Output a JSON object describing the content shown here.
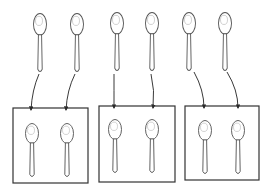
{
  "diagram": {
    "stroke_color": "#555555",
    "box_color": "#333333",
    "arrow_color": "#222222",
    "top_spoons": [
      {
        "id": "spoon-1",
        "x": 40,
        "y": 14
      },
      {
        "id": "spoon-2",
        "x": 77,
        "y": 14
      },
      {
        "id": "spoon-3",
        "x": 117,
        "y": 13
      },
      {
        "id": "spoon-4",
        "x": 152,
        "y": 13
      },
      {
        "id": "spoon-5",
        "x": 189,
        "y": 13
      },
      {
        "id": "spoon-6",
        "x": 225,
        "y": 13
      }
    ],
    "groups": [
      {
        "id": "group-1",
        "box": {
          "x": 13,
          "y": 108,
          "w": 75,
          "h": 75
        },
        "spoons": [
          {
            "x": 32,
            "y": 124
          },
          {
            "x": 67,
            "y": 124
          }
        ]
      },
      {
        "id": "group-2",
        "box": {
          "x": 99,
          "y": 106,
          "w": 76,
          "h": 76
        },
        "spoons": [
          {
            "x": 115,
            "y": 120
          },
          {
            "x": 152,
            "y": 120
          }
        ]
      },
      {
        "id": "group-3",
        "box": {
          "x": 185,
          "y": 106,
          "w": 74,
          "h": 74
        },
        "spoons": [
          {
            "x": 205,
            "y": 121
          },
          {
            "x": 238,
            "y": 121
          }
        ]
      }
    ],
    "arrows": [
      {
        "from": [
          39,
          74
        ],
        "ctrl": [
          32,
          90
        ],
        "to": [
          31,
          110
        ]
      },
      {
        "from": [
          75,
          74
        ],
        "ctrl": [
          67,
          90
        ],
        "to": [
          66,
          110
        ]
      },
      {
        "from": [
          114,
          74
        ],
        "ctrl": [
          114,
          90
        ],
        "to": [
          114,
          108
        ]
      },
      {
        "from": [
          151,
          74
        ],
        "ctrl": [
          155,
          90
        ],
        "to": [
          153,
          108
        ]
      },
      {
        "from": [
          194,
          72
        ],
        "ctrl": [
          204,
          90
        ],
        "to": [
          204,
          108
        ]
      },
      {
        "from": [
          227,
          72
        ],
        "ctrl": [
          238,
          90
        ],
        "to": [
          238,
          108
        ]
      }
    ]
  }
}
